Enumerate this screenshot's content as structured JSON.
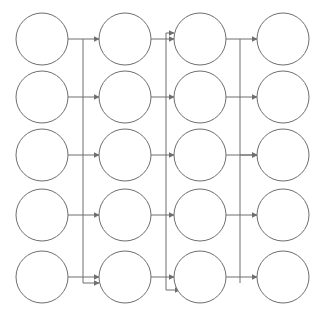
{
  "diagram": {
    "type": "flow-graph",
    "canvas": {
      "width": 320,
      "height": 318,
      "background": "#ffffff"
    },
    "style": {
      "node_stroke": "#6e6e6e",
      "node_fill": "#ffffff",
      "edge_stroke": "#6e6e6e",
      "stroke_width": 1,
      "node_radius": 26
    },
    "columns": [
      {
        "id": "col1",
        "index": 0,
        "cx": 42
      },
      {
        "id": "col2",
        "index": 1,
        "cx": 125
      },
      {
        "id": "col3",
        "index": 2,
        "cx": 200
      },
      {
        "id": "col4",
        "index": 3,
        "cx": 283
      }
    ],
    "rows": [
      {
        "id": "row1",
        "index": 0,
        "cy": 39
      },
      {
        "id": "row2",
        "index": 1,
        "cy": 97
      },
      {
        "id": "row3",
        "index": 2,
        "cy": 155
      },
      {
        "id": "row4",
        "index": 3,
        "cy": 215
      },
      {
        "id": "row5",
        "index": 4,
        "cy": 277
      }
    ],
    "nodes": [
      {
        "id": "n-r1c1",
        "label": "",
        "col": 0,
        "row": 0,
        "cx": 42,
        "cy": 39,
        "r": 26
      },
      {
        "id": "n-r1c2",
        "label": "",
        "col": 1,
        "row": 0,
        "cx": 125,
        "cy": 39,
        "r": 26
      },
      {
        "id": "n-r1c3",
        "label": "",
        "col": 2,
        "row": 0,
        "cx": 200,
        "cy": 39,
        "r": 26
      },
      {
        "id": "n-r1c4",
        "label": "",
        "col": 3,
        "row": 0,
        "cx": 283,
        "cy": 39,
        "r": 26
      },
      {
        "id": "n-r2c1",
        "label": "",
        "col": 0,
        "row": 1,
        "cx": 42,
        "cy": 97,
        "r": 26
      },
      {
        "id": "n-r2c2",
        "label": "",
        "col": 1,
        "row": 1,
        "cx": 125,
        "cy": 97,
        "r": 26
      },
      {
        "id": "n-r2c3",
        "label": "",
        "col": 2,
        "row": 1,
        "cx": 200,
        "cy": 97,
        "r": 26
      },
      {
        "id": "n-r2c4",
        "label": "",
        "col": 3,
        "row": 1,
        "cx": 283,
        "cy": 97,
        "r": 26
      },
      {
        "id": "n-r3c1",
        "label": "",
        "col": 0,
        "row": 2,
        "cx": 42,
        "cy": 155,
        "r": 26
      },
      {
        "id": "n-r3c2",
        "label": "",
        "col": 1,
        "row": 2,
        "cx": 125,
        "cy": 155,
        "r": 26
      },
      {
        "id": "n-r3c3",
        "label": "",
        "col": 2,
        "row": 2,
        "cx": 200,
        "cy": 155,
        "r": 26
      },
      {
        "id": "n-r3c4",
        "label": "",
        "col": 3,
        "row": 2,
        "cx": 283,
        "cy": 155,
        "r": 26
      },
      {
        "id": "n-r4c1",
        "label": "",
        "col": 0,
        "row": 3,
        "cx": 42,
        "cy": 215,
        "r": 26
      },
      {
        "id": "n-r4c2",
        "label": "",
        "col": 1,
        "row": 3,
        "cx": 125,
        "cy": 215,
        "r": 26
      },
      {
        "id": "n-r4c3",
        "label": "",
        "col": 2,
        "row": 3,
        "cx": 200,
        "cy": 215,
        "r": 26
      },
      {
        "id": "n-r4c4",
        "label": "",
        "col": 3,
        "row": 3,
        "cx": 283,
        "cy": 215,
        "r": 26
      },
      {
        "id": "n-r5c1",
        "label": "",
        "col": 0,
        "row": 4,
        "cx": 42,
        "cy": 277,
        "r": 26
      },
      {
        "id": "n-r5c2",
        "label": "",
        "col": 1,
        "row": 4,
        "cx": 125,
        "cy": 277,
        "r": 26
      },
      {
        "id": "n-r5c3",
        "label": "",
        "col": 2,
        "row": 4,
        "cx": 200,
        "cy": 277,
        "r": 26
      },
      {
        "id": "n-r5c4",
        "label": "",
        "col": 3,
        "row": 4,
        "cx": 283,
        "cy": 277,
        "r": 26
      }
    ],
    "bus_lines": [
      {
        "id": "bus-a",
        "x": 83,
        "y1": 39,
        "y2": 283,
        "note": "column1-to-column2 vertical bus"
      },
      {
        "id": "bus-b",
        "x": 166,
        "y1": 33,
        "y2": 290,
        "note": "column2-to-column3 vertical bus"
      },
      {
        "id": "bus-c",
        "x": 240,
        "y1": 39,
        "y2": 283,
        "note": "column3-to-column4 vertical bus"
      }
    ],
    "edges": [
      {
        "id": "e-r1-c1c2",
        "from": "n-r1c1",
        "to": "n-r1c2",
        "y": 39,
        "x1": 68,
        "x2": 99,
        "arrow": true
      },
      {
        "id": "e-r2-c1c2",
        "from": "n-r2c1",
        "to": "n-r2c2",
        "y": 97,
        "x1": 68,
        "x2": 99,
        "arrow": true
      },
      {
        "id": "e-r3-c1c2",
        "from": "n-r3c1",
        "to": "n-r3c2",
        "y": 155,
        "x1": 68,
        "x2": 99,
        "arrow": true
      },
      {
        "id": "e-r4-c1c2",
        "from": "n-r4c1",
        "to": "n-r4c2",
        "y": 215,
        "x1": 68,
        "x2": 99,
        "arrow": true
      },
      {
        "id": "e-r5-c1c2",
        "from": "n-r5c1",
        "to": "n-r5c2",
        "y": 277,
        "x1": 68,
        "x2": 99,
        "arrow": true
      },
      {
        "id": "e-r1-c2c3",
        "from": "n-r1c2",
        "to": "n-r1c3",
        "y": 39,
        "x1": 151,
        "x2": 174,
        "arrow": true
      },
      {
        "id": "e-r2-c2c3",
        "from": "n-r2c2",
        "to": "n-r2c3",
        "y": 97,
        "x1": 151,
        "x2": 174,
        "arrow": true
      },
      {
        "id": "e-r3-c2c3",
        "from": "n-r3c2",
        "to": "n-r3c3",
        "y": 155,
        "x1": 151,
        "x2": 174,
        "arrow": true
      },
      {
        "id": "e-r4-c2c3",
        "from": "n-r4c2",
        "to": "n-r4c3",
        "y": 215,
        "x1": 151,
        "x2": 174,
        "arrow": true
      },
      {
        "id": "e-r5-c2c3",
        "from": "n-r5c2",
        "to": "n-r5c3",
        "y": 277,
        "x1": 151,
        "x2": 174,
        "arrow": true
      },
      {
        "id": "e-r1-c3c4",
        "from": "n-r1c3",
        "to": "n-r1c4",
        "y": 39,
        "x1": 226,
        "x2": 257,
        "arrow": true
      },
      {
        "id": "e-r2-c3c4",
        "from": "n-r2c3",
        "to": "n-r2c4",
        "y": 97,
        "x1": 226,
        "x2": 257,
        "arrow": true
      },
      {
        "id": "e-r3-c3c4",
        "from": "n-r3c3",
        "to": "n-r3c4",
        "y": 155,
        "x1": 226,
        "x2": 257,
        "arrow": true
      },
      {
        "id": "e-r4-c3c4",
        "from": "n-r4c3",
        "to": "n-r4c4",
        "y": 215,
        "x1": 226,
        "x2": 257,
        "arrow": true
      },
      {
        "id": "e-r5-c3c4",
        "from": "n-r5c3",
        "to": "n-r5c4",
        "y": 277,
        "x1": 226,
        "x2": 257,
        "arrow": true
      }
    ],
    "bus_feeds": [
      {
        "id": "feed-a",
        "bus": "bus-a",
        "x": 83,
        "y": 283,
        "to_x": 99,
        "to_y": 283,
        "arrow": true
      },
      {
        "id": "feed-b",
        "bus": "bus-b",
        "x": 166,
        "y": 290,
        "to_x": 180,
        "to_y": 290,
        "arrow": true
      },
      {
        "id": "feed-b-top",
        "bus": "bus-b",
        "x": 166,
        "y": 33,
        "to_x": 174,
        "to_y": 33,
        "arrow": true
      },
      {
        "id": "feed-c",
        "bus": "bus-c",
        "x": 240,
        "y": 155,
        "to_x": 257,
        "to_y": 155,
        "arrow": true
      }
    ],
    "counts": {
      "nodes": 20,
      "columns": 4,
      "rows": 5,
      "edges": 15,
      "bus_lines": 3
    }
  }
}
